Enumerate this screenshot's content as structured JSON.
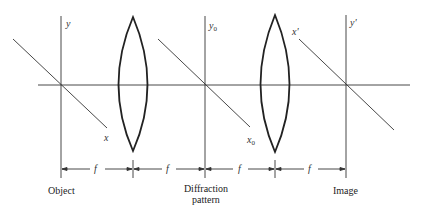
{
  "diagram": {
    "type": "optical 4f imaging system",
    "planes": [
      {
        "id": "object",
        "label": "Object",
        "axis_x": "x",
        "axis_y": "y"
      },
      {
        "id": "diffraction",
        "label": "Diffraction pattern",
        "label_lines": [
          "Diffraction",
          "pattern"
        ],
        "axis_x": "x",
        "axis_x_sub": "0",
        "axis_y": "y",
        "axis_y_sub": "0"
      },
      {
        "id": "image",
        "label": "Image",
        "axis_x": "x'",
        "axis_y": "y'"
      }
    ],
    "lenses": [
      {
        "id": "lens-1",
        "type": "biconvex"
      },
      {
        "id": "lens-2",
        "type": "biconvex"
      }
    ],
    "distances": [
      "f",
      "f",
      "f",
      "f"
    ],
    "colors": {
      "line": "#222222",
      "text": "#222222",
      "background": "#ffffff"
    }
  }
}
